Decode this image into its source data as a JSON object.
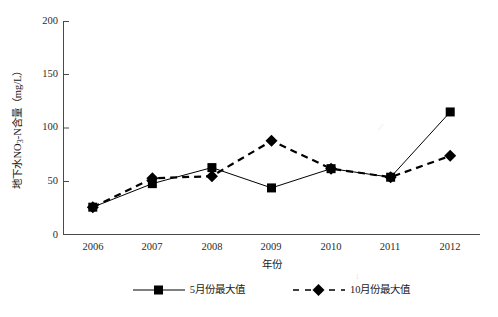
{
  "chart_data": {
    "type": "line",
    "title": "",
    "xlabel": "年份",
    "ylabel": "地下水NO3-N含量（mg/L）",
    "ylabel_parts": {
      "prefix": "地下水NO",
      "subscript": "3",
      "suffix": "-N含量（mg/L）"
    },
    "categories": [
      "2006",
      "2007",
      "2008",
      "2009",
      "2010",
      "2011",
      "2012"
    ],
    "x": [
      2006,
      2007,
      2008,
      2009,
      2010,
      2011,
      2012
    ],
    "ylim": [
      0,
      200
    ],
    "yticks": [
      "0",
      "50",
      "100",
      "150",
      "200"
    ],
    "ytick_values": [
      0,
      50,
      100,
      150,
      200
    ],
    "grid": false,
    "legend_position": "bottom",
    "series": [
      {
        "name": "5月份最大值",
        "values": [
          26,
          48,
          63,
          44,
          62,
          54,
          115
        ],
        "marker": "square",
        "linestyle": "solid",
        "color": "#000000"
      },
      {
        "name": "10月份最大值",
        "values": [
          26,
          53,
          55,
          88,
          62,
          54,
          74
        ],
        "marker": "diamond",
        "linestyle": "dashed",
        "color": "#000000"
      }
    ]
  },
  "legend": {
    "items": [
      {
        "label": "5月份最大值",
        "marker": "square-marker-icon",
        "linestyle": "solid"
      },
      {
        "label": "10月份最大值",
        "marker": "diamond-marker-icon",
        "linestyle": "dashed"
      }
    ]
  },
  "colors": {
    "axis": "#4a4a4a",
    "series": "#000000",
    "text": "#1a1a1a",
    "background": "#ffffff"
  }
}
